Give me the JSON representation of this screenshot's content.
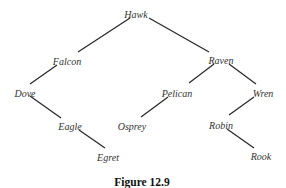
{
  "diagram": {
    "type": "binary-tree",
    "caption": "Figure 12.9",
    "nodes": {
      "hawk": {
        "label": "Hawk",
        "x": 136,
        "y": 14
      },
      "falcon": {
        "label": "Falcon",
        "x": 67,
        "y": 61
      },
      "raven": {
        "label": "Raven",
        "x": 221,
        "y": 60
      },
      "dove": {
        "label": "Dove",
        "x": 25,
        "y": 93
      },
      "pelican": {
        "label": "Pelican",
        "x": 177,
        "y": 93
      },
      "wren": {
        "label": "Wren",
        "x": 263,
        "y": 93
      },
      "eagle": {
        "label": "Eagle",
        "x": 70,
        "y": 126
      },
      "osprey": {
        "label": "Osprey",
        "x": 132,
        "y": 126
      },
      "robin": {
        "label": "Robin",
        "x": 221,
        "y": 125
      },
      "egret": {
        "label": "Egret",
        "x": 108,
        "y": 157
      },
      "rook": {
        "label": "Rook",
        "x": 261,
        "y": 156
      }
    },
    "edges": [
      {
        "from": "Hawk",
        "to": "Falcon",
        "x1": 130,
        "y1": 18,
        "x2": 78,
        "y2": 52
      },
      {
        "from": "Hawk",
        "to": "Raven",
        "x1": 149,
        "y1": 18,
        "x2": 209,
        "y2": 52
      },
      {
        "from": "Falcon",
        "to": "Dove",
        "x1": 57,
        "y1": 65,
        "x2": 30,
        "y2": 84
      },
      {
        "from": "Dove",
        "to": "Eagle",
        "x1": 30,
        "y1": 96,
        "x2": 61,
        "y2": 118
      },
      {
        "from": "Eagle",
        "to": "Egret",
        "x1": 79,
        "y1": 130,
        "x2": 105,
        "y2": 148
      },
      {
        "from": "Raven",
        "to": "Pelican",
        "x1": 214,
        "y1": 64,
        "x2": 189,
        "y2": 83
      },
      {
        "from": "Raven",
        "to": "Wren",
        "x1": 229,
        "y1": 64,
        "x2": 256,
        "y2": 84
      },
      {
        "from": "Pelican",
        "to": "Osprey",
        "x1": 168,
        "y1": 97,
        "x2": 141,
        "y2": 117
      },
      {
        "from": "Wren",
        "to": "Robin",
        "x1": 254,
        "y1": 97,
        "x2": 229,
        "y2": 115
      },
      {
        "from": "Robin",
        "to": "Rook",
        "x1": 227,
        "y1": 129,
        "x2": 254,
        "y2": 148
      }
    ],
    "caption_position": {
      "x": 142,
      "y": 186
    }
  }
}
